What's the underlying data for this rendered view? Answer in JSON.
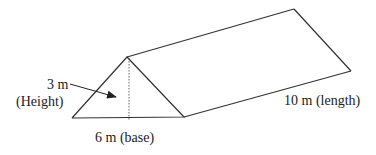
{
  "diagram": {
    "type": "triangular-prism",
    "labels": {
      "height_value": "3 m",
      "height_caption": "(Height)",
      "base": "6 m (base)",
      "length": "10 m (length)"
    },
    "dimensions": {
      "height_m": 3,
      "base_m": 6,
      "length_m": 10
    },
    "colors": {
      "stroke": "#333333",
      "background": "#ffffff"
    }
  }
}
